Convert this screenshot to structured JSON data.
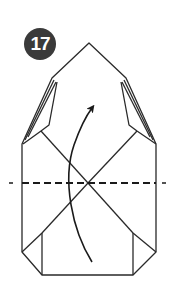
{
  "step": {
    "number": "17",
    "badge_color": "#3a3a3a"
  },
  "diagram": {
    "fold_type": "valley fold",
    "fold_line": "dashed horizontal line",
    "arrow_direction": "up",
    "line_color": "#222222",
    "paper_color": "#ffffff"
  }
}
